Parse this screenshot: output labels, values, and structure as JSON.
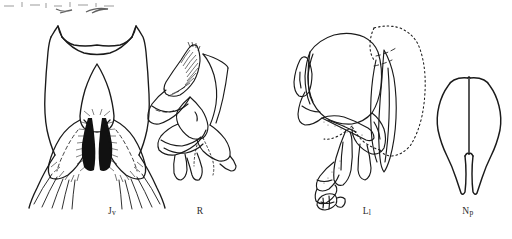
{
  "plate": {
    "width": 512,
    "height": 239,
    "background_color": "#ffffff",
    "ink_color": "#1a1a1a",
    "label_color": "#2a2a2a",
    "description": "Scientific line-drawing plate of four anatomical structures"
  },
  "figures": [
    {
      "id": "jv",
      "label_main": "J",
      "label_sub": "v",
      "label_full": "Jv",
      "label_x": 112,
      "label_y": 213,
      "name": "ventral-juxta-plate"
    },
    {
      "id": "r",
      "label_main": "R",
      "label_sub": "",
      "label_full": "R",
      "label_x": 200,
      "label_y": 213,
      "name": "lateral-sclerite-group"
    },
    {
      "id": "ll",
      "label_main": "L",
      "label_sub": "l",
      "label_full": "Ll",
      "label_x": 367,
      "label_y": 213,
      "name": "left-lateral-complex"
    },
    {
      "id": "np",
      "label_main": "N",
      "label_sub": "p",
      "label_full": "Np",
      "label_x": 467,
      "label_y": 213,
      "name": "posterior-plate"
    }
  ],
  "artifacts": {
    "top_edge_note": "cut-off scan marks along upper margin"
  }
}
